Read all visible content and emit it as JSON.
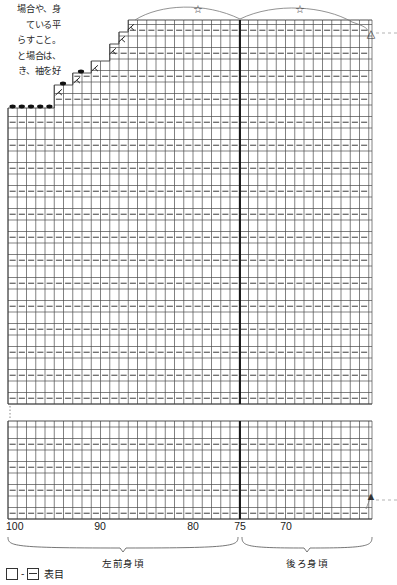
{
  "note": {
    "lines": [
      "場合や、身",
      "ている平",
      "らすこと。",
      "と場合は、",
      "き、袖を好"
    ]
  },
  "chart_data": {
    "type": "table",
    "title": "",
    "xlabel": "",
    "ylabel": "",
    "grid": true,
    "axis": {
      "ticks": [
        {
          "label": "100",
          "x": 8
        },
        {
          "label": "90",
          "x": 100
        },
        {
          "label": "80",
          "x": 193
        },
        {
          "label": "75",
          "x": 240
        },
        {
          "label": "70",
          "x": 286
        }
      ],
      "y": 520
    },
    "columns_total": 42,
    "column_width": 9.25,
    "row_height": 11.5,
    "sections": [
      {
        "name": "left-front-body",
        "label": "左前身頃",
        "from_x": 8,
        "to_x": 238,
        "caption_x": 123
      },
      {
        "name": "back-body",
        "label": "後ろ身頃",
        "from_x": 242,
        "to_x": 372,
        "caption_x": 307
      }
    ],
    "center_divider_x": 240,
    "break_gap": {
      "top": 404,
      "bottom": 421
    },
    "steps": [
      {
        "top_y": 108,
        "left_x": 8,
        "right_x": 54,
        "dots": 5,
        "decrease": false
      },
      {
        "top_y": 85,
        "left_x": 54,
        "right_x": 72,
        "dots": 1,
        "decrease": true
      },
      {
        "top_y": 73,
        "left_x": 72,
        "right_x": 90,
        "dots": 1,
        "decrease": true
      },
      {
        "top_y": 61,
        "left_x": 90,
        "right_x": 108,
        "dots": 0,
        "decrease": true
      },
      {
        "top_y": 44,
        "left_x": 108,
        "right_x": 117,
        "dots": 0,
        "decrease": true
      },
      {
        "top_y": 32,
        "left_x": 117,
        "right_x": 126,
        "dots": 0,
        "decrease": true
      },
      {
        "top_y": 20,
        "left_x": 126,
        "right_x": 135,
        "dots": 0,
        "decrease": true
      }
    ],
    "markers": [
      {
        "name": "star-left",
        "glyph": "☆",
        "x": 198,
        "y": 9
      },
      {
        "name": "star-right",
        "glyph": "☆",
        "x": 300,
        "y": 9
      },
      {
        "name": "triangle-open",
        "glyph": "△",
        "x": 371,
        "y": 33
      },
      {
        "name": "triangle-filled",
        "glyph": "▲",
        "x": 371,
        "y": 496
      }
    ]
  },
  "legend": {
    "left_symbol": "knit-box-icon",
    "separator": "-",
    "right_symbol": "knit-box-dash-icon",
    "text": "表目"
  },
  "colors": {
    "grid": "#4a4a4a",
    "dash": "#555555",
    "divider": "#111111",
    "marker": "#333333"
  }
}
